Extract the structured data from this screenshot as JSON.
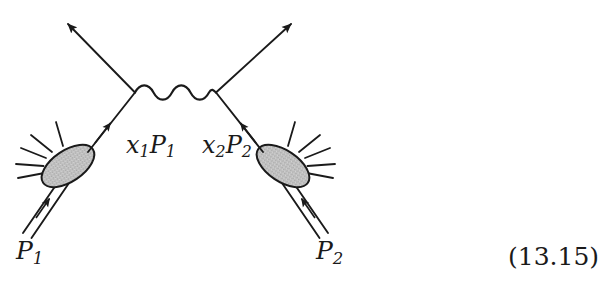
{
  "figure": {
    "kind": "feynman-diagram",
    "equation_number": "(13.15)",
    "background_color": "#ffffff",
    "ink_color": "#1a1a1a",
    "blob_fill_color": "#bfbfbf",
    "blob_stroke_color": "#1a1a1a"
  },
  "labels": {
    "parton_left": {
      "base": "x",
      "sub": "1",
      "base2": "P",
      "sub2": "1",
      "text": "x1P1"
    },
    "parton_right": {
      "base": "x",
      "sub": "2",
      "base2": "P",
      "sub2": "2",
      "text": "x2P2"
    },
    "hadron_left": {
      "base": "P",
      "sub": "1",
      "text": "P1"
    },
    "hadron_right": {
      "base": "P",
      "sub": "2",
      "text": "P2"
    },
    "equation_number": "(13.15)"
  },
  "elements": {
    "photon_propagator_name": "wavy-photon-line",
    "left_blob_name": "hadron-blob-left",
    "right_blob_name": "hadron-blob-right",
    "outgoing_left_name": "outgoing-lepton-left",
    "outgoing_right_name": "outgoing-lepton-right"
  }
}
